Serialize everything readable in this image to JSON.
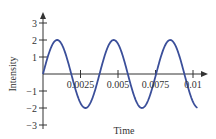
{
  "chart_data": {
    "type": "line",
    "title": "",
    "xlabel": "Time",
    "ylabel": "Intensity",
    "xlim": [
      0,
      0.0105
    ],
    "ylim": [
      -3,
      3
    ],
    "x_ticks": [
      0.0025,
      0.005,
      0.0075,
      0.01
    ],
    "x_tick_labels": [
      "0.0025",
      "0.005",
      "0.0075",
      "0.01"
    ],
    "y_ticks": [
      -3,
      -2,
      -1,
      1,
      2,
      3
    ],
    "y_tick_labels": [
      "−3",
      "−2",
      "−1",
      "1",
      "2",
      "3"
    ],
    "grid": false,
    "legend": null,
    "series": [
      {
        "name": "sine wave",
        "function": "2*sin(2*pi*t/0.00377)",
        "amplitude": 2,
        "period": 0.00377,
        "t_start": 0,
        "t_end": 0.0103,
        "color": "#3b4f9a"
      }
    ]
  },
  "colors": {
    "axis": "#333333",
    "curve": "#3b4f9a"
  }
}
